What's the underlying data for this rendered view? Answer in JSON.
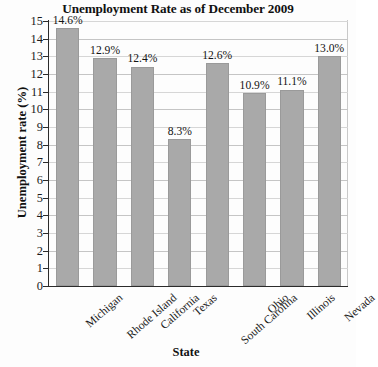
{
  "chart_data": {
    "type": "bar",
    "title": "Unemployment Rate as of December 2009",
    "xlabel": "State",
    "ylabel": "Unemployment rate (%)",
    "categories": [
      "Michigan",
      "Rhode Island",
      "California",
      "Texas",
      "South Carolina",
      "Ohio",
      "Illinois",
      "Nevada"
    ],
    "values": [
      14.6,
      12.9,
      12.4,
      8.3,
      12.6,
      10.9,
      11.1,
      13.0
    ],
    "value_labels": [
      "14.6%",
      "12.9%",
      "12.4%",
      "8.3%",
      "12.6%",
      "10.9%",
      "11.1%",
      "13.0%"
    ],
    "ylim": [
      0,
      15
    ],
    "ytick_labels": [
      "15",
      "14",
      "13",
      "12",
      "11",
      "10",
      "9",
      "8",
      "7",
      "6",
      "5",
      "4",
      "3",
      "2",
      "1",
      "0"
    ],
    "ytick_values": [
      15,
      14,
      13,
      12,
      11,
      10,
      9,
      8,
      7,
      6,
      5,
      4,
      3,
      2,
      1,
      0
    ],
    "grid": true,
    "legend": false,
    "bar_color": "#a9a9a9",
    "axis_color": "#2b2b2b",
    "grid_color": "#c5c5c5"
  }
}
